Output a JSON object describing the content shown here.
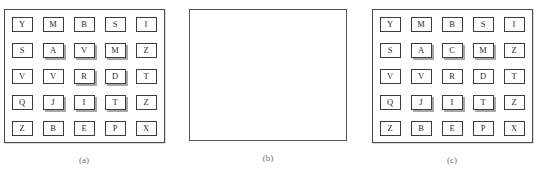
{
  "figure": {
    "panels": [
      {
        "id": "panel-a",
        "caption": "(a)",
        "type": "letter-grid",
        "rows": 5,
        "cols": 5,
        "cells": [
          [
            {
              "letter": "Y",
              "shadowed": false
            },
            {
              "letter": "M",
              "shadowed": false
            },
            {
              "letter": "B",
              "shadowed": false
            },
            {
              "letter": "S",
              "shadowed": false
            },
            {
              "letter": "I",
              "shadowed": false
            }
          ],
          [
            {
              "letter": "S",
              "shadowed": false
            },
            {
              "letter": "A",
              "shadowed": true
            },
            {
              "letter": "V",
              "shadowed": true
            },
            {
              "letter": "M",
              "shadowed": true
            },
            {
              "letter": "Z",
              "shadowed": false
            }
          ],
          [
            {
              "letter": "V",
              "shadowed": false
            },
            {
              "letter": "V",
              "shadowed": false
            },
            {
              "letter": "R",
              "shadowed": true
            },
            {
              "letter": "D",
              "shadowed": true
            },
            {
              "letter": "T",
              "shadowed": false
            }
          ],
          [
            {
              "letter": "Q",
              "shadowed": false
            },
            {
              "letter": "J",
              "shadowed": true
            },
            {
              "letter": "I",
              "shadowed": true
            },
            {
              "letter": "T",
              "shadowed": true
            },
            {
              "letter": "Z",
              "shadowed": false
            }
          ],
          [
            {
              "letter": "Z",
              "shadowed": false
            },
            {
              "letter": "B",
              "shadowed": false
            },
            {
              "letter": "E",
              "shadowed": false
            },
            {
              "letter": "P",
              "shadowed": false
            },
            {
              "letter": "X",
              "shadowed": false
            }
          ]
        ]
      },
      {
        "id": "panel-b",
        "caption": "(b)",
        "type": "empty-box",
        "cells": []
      },
      {
        "id": "panel-c",
        "caption": "(c)",
        "type": "letter-grid",
        "rows": 5,
        "cols": 5,
        "cells": [
          [
            {
              "letter": "Y",
              "shadowed": false
            },
            {
              "letter": "M",
              "shadowed": false
            },
            {
              "letter": "B",
              "shadowed": false
            },
            {
              "letter": "S",
              "shadowed": false
            },
            {
              "letter": "I",
              "shadowed": false
            }
          ],
          [
            {
              "letter": "S",
              "shadowed": false
            },
            {
              "letter": "A",
              "shadowed": true
            },
            {
              "letter": "C",
              "shadowed": true
            },
            {
              "letter": "M",
              "shadowed": true
            },
            {
              "letter": "Z",
              "shadowed": false
            }
          ],
          [
            {
              "letter": "V",
              "shadowed": false
            },
            {
              "letter": "V",
              "shadowed": false
            },
            {
              "letter": "R",
              "shadowed": false
            },
            {
              "letter": "D",
              "shadowed": false
            },
            {
              "letter": "T",
              "shadowed": false
            }
          ],
          [
            {
              "letter": "Q",
              "shadowed": false
            },
            {
              "letter": "J",
              "shadowed": true
            },
            {
              "letter": "I",
              "shadowed": true
            },
            {
              "letter": "T",
              "shadowed": true
            },
            {
              "letter": "Z",
              "shadowed": false
            }
          ],
          [
            {
              "letter": "Z",
              "shadowed": false
            },
            {
              "letter": "B",
              "shadowed": false
            },
            {
              "letter": "E",
              "shadowed": false
            },
            {
              "letter": "P",
              "shadowed": false
            },
            {
              "letter": "X",
              "shadowed": false
            }
          ]
        ]
      }
    ],
    "colors": {
      "background": "#ffffff",
      "panel_border": "#4a4a4a",
      "tile_border": "#3d3d3d",
      "tile_fill": "#ffffff",
      "tile_shadow": "#a8a8a8",
      "letter_text": "#2b2b2b",
      "caption_text": "#6d6d6d"
    }
  }
}
